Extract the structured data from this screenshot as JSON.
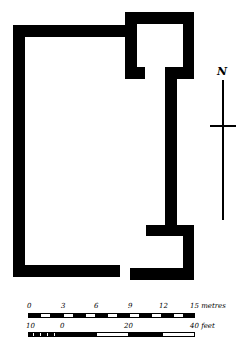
{
  "plan": {
    "title": "Ground plan of rectangular building with tower and annex",
    "north_label": "N"
  },
  "scale_metres": {
    "ticks": [
      "0",
      "3",
      "6",
      "9",
      "12"
    ],
    "end_label": "15 metres"
  },
  "scale_feet": {
    "ticks": [
      "10",
      "0",
      "20"
    ],
    "end_label": "40 feet"
  },
  "colors": {
    "wall": "#000000",
    "background": "#ffffff"
  }
}
